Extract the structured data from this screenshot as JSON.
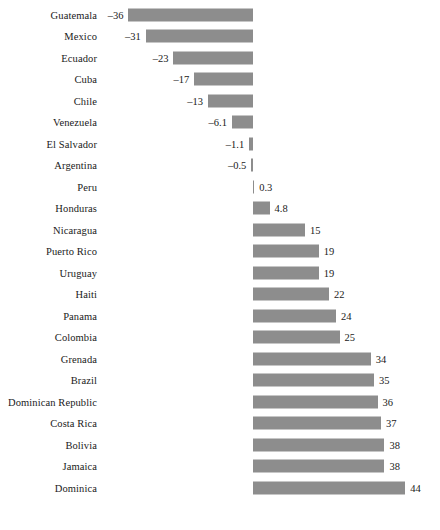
{
  "chart_data": {
    "type": "bar",
    "orientation": "horizontal",
    "title": "",
    "subtitle": "",
    "xlabel": "",
    "ylabel": "",
    "grid": false,
    "legend": false,
    "axis_zero": 0,
    "xlim": [
      -40,
      48
    ],
    "categories": [
      "Guatemala",
      "Mexico",
      "Ecuador",
      "Cuba",
      "Chile",
      "Venezuela",
      "El Salvador",
      "Argentina",
      "Peru",
      "Honduras",
      "Nicaragua",
      "Puerto Rico",
      "Uruguay",
      "Haiti",
      "Panama",
      "Colombia",
      "Grenada",
      "Brazil",
      "Dominican Republic",
      "Costa Rica",
      "Bolivia",
      "Jamaica",
      "Dominica"
    ],
    "values": [
      -36,
      -31,
      -23,
      -17,
      -13,
      -6.1,
      -1.1,
      -0.5,
      0.3,
      4.8,
      15,
      19,
      19,
      22,
      24,
      25,
      34,
      35,
      36,
      37,
      38,
      38,
      44
    ],
    "value_labels": [
      "–36",
      "–31",
      "–23",
      "–17",
      "–13",
      "–6.1",
      "–1.1",
      "–0.5",
      "0.3",
      "4.8",
      "15",
      "19",
      "19",
      "22",
      "24",
      "25",
      "34",
      "35",
      "36",
      "37",
      "38",
      "38",
      "44"
    ],
    "bar_color": "#8d8d8d",
    "text_color": "#1a1a1a",
    "background": "#ffffff"
  }
}
